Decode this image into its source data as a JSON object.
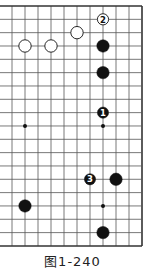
{
  "diagram": {
    "type": "go-board-partial",
    "board_size": 19,
    "visible_columns": 11,
    "visible_rows": 19,
    "edges_shown": [
      "top",
      "right",
      "bottom"
    ],
    "grid": {
      "origin_x": 12,
      "origin_y": 6,
      "spacing_x": 13,
      "spacing_y": 13.33,
      "line_color": "#555555",
      "edge_color": "#333333"
    },
    "star_points": [
      {
        "col": 1,
        "row": 9
      },
      {
        "col": 7,
        "row": 9
      },
      {
        "col": 7,
        "row": 15
      }
    ],
    "stones": [
      {
        "color": "white",
        "col": 1,
        "row": 3,
        "label": ""
      },
      {
        "color": "white",
        "col": 3,
        "row": 3,
        "label": ""
      },
      {
        "color": "white",
        "col": 5,
        "row": 2,
        "label": ""
      },
      {
        "color": "white",
        "col": 7,
        "row": 1,
        "label": "2"
      },
      {
        "color": "black",
        "col": 7,
        "row": 3,
        "label": ""
      },
      {
        "color": "black",
        "col": 7,
        "row": 5,
        "label": ""
      },
      {
        "color": "black",
        "col": 7,
        "row": 8,
        "label": "1"
      },
      {
        "color": "black",
        "col": 6,
        "row": 13,
        "label": "3"
      },
      {
        "color": "black",
        "col": 8,
        "row": 13,
        "label": ""
      },
      {
        "color": "black",
        "col": 1,
        "row": 15,
        "label": ""
      },
      {
        "color": "black",
        "col": 7,
        "row": 17,
        "label": ""
      }
    ]
  },
  "caption": "图1-240"
}
